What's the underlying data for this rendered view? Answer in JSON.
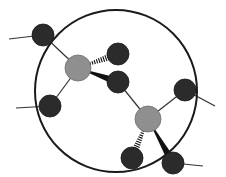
{
  "diagram": {
    "type": "molecular-structure",
    "colors": {
      "outline": "#1a1a1a",
      "dark_atom": "#2b2b2b",
      "gray_atom": "#8f8f8f",
      "bond": "#333333"
    },
    "enclosing_circle": {
      "cx": 116,
      "cy": 91,
      "r": 81
    },
    "atoms": [
      {
        "id": "d1",
        "kind": "dark",
        "cx": 43,
        "cy": 35,
        "r": 11
      },
      {
        "id": "gA",
        "kind": "gray",
        "cx": 78,
        "cy": 68,
        "r": 13
      },
      {
        "id": "d2",
        "kind": "dark",
        "cx": 118,
        "cy": 54,
        "r": 11
      },
      {
        "id": "d3",
        "kind": "dark",
        "cx": 118,
        "cy": 82,
        "r": 11
      },
      {
        "id": "d4",
        "kind": "dark",
        "cx": 50,
        "cy": 106,
        "r": 11
      },
      {
        "id": "gB",
        "kind": "gray",
        "cx": 148,
        "cy": 119,
        "r": 13
      },
      {
        "id": "d5",
        "kind": "dark",
        "cx": 185,
        "cy": 90,
        "r": 11
      },
      {
        "id": "d6",
        "kind": "dark",
        "cx": 132,
        "cy": 158,
        "r": 11
      },
      {
        "id": "d7",
        "kind": "dark",
        "cx": 173,
        "cy": 163,
        "r": 11
      }
    ],
    "bonds": [
      {
        "from": "d1",
        "to": "gA",
        "style": "single"
      },
      {
        "from": "gA",
        "to": "d2",
        "style": "hashed"
      },
      {
        "from": "gA",
        "to": "d3",
        "style": "wedge"
      },
      {
        "from": "gA",
        "to": "d4",
        "style": "single"
      },
      {
        "from": "d3",
        "to": "gB",
        "style": "single"
      },
      {
        "from": "gB",
        "to": "d5",
        "style": "single"
      },
      {
        "from": "gB",
        "to": "d6",
        "style": "hashed"
      },
      {
        "from": "gB",
        "to": "d7",
        "style": "wedge"
      }
    ],
    "external_bonds": [
      {
        "from": "d1",
        "x2": 9,
        "y2": 39
      },
      {
        "from": "d4",
        "x2": 16,
        "y2": 108
      },
      {
        "from": "d5",
        "x2": 215,
        "y2": 106
      },
      {
        "from": "d7",
        "x2": 203,
        "y2": 166
      }
    ]
  }
}
